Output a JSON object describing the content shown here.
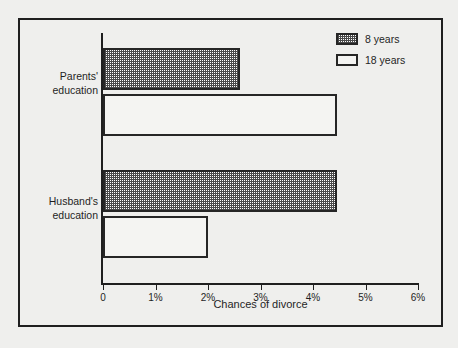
{
  "chart_data": {
    "type": "bar",
    "orientation": "horizontal",
    "title": "",
    "xlabel": "Chances of divorce",
    "ylabel": "",
    "xlim": [
      0,
      6
    ],
    "xtick_labels": [
      "0",
      "1%",
      "2%",
      "3%",
      "4%",
      "5%",
      "6%"
    ],
    "xtick_values": [
      0,
      1,
      2,
      3,
      4,
      5,
      6
    ],
    "grid": false,
    "legend_position": "top-right",
    "categories": [
      "Parents' education",
      "Husband's education"
    ],
    "category_lines": [
      [
        "Parents'",
        "education"
      ],
      [
        "Husband's",
        "education"
      ]
    ],
    "series": [
      {
        "name": "8 years",
        "values": [
          2.6,
          4.45
        ],
        "fill": "hatch-checker",
        "color": "#4a4a4a"
      },
      {
        "name": "18 years",
        "values": [
          4.45,
          2.0
        ],
        "fill": "solid",
        "color": "#f4f4f2"
      }
    ],
    "bars": [
      {
        "category": "Parents' education",
        "series": "8 years",
        "value": 2.6,
        "value_label": "2.6%"
      },
      {
        "category": "Parents' education",
        "series": "18 years",
        "value": 4.45,
        "value_label": "4.45%"
      },
      {
        "category": "Husband's education",
        "series": "8 years",
        "value": 4.45,
        "value_label": "4.45%"
      },
      {
        "category": "Husband's education",
        "series": "18 years",
        "value": 2.0,
        "value_label": "2%"
      }
    ]
  },
  "legend": {
    "items": [
      {
        "label": "8 years"
      },
      {
        "label": "18 years"
      }
    ]
  },
  "axis": {
    "x_title": "Chances of divorce",
    "ticks": [
      "0",
      "1%",
      "2%",
      "3%",
      "4%",
      "5%",
      "6%"
    ]
  },
  "categories": {
    "parents": {
      "line1": "Parents'",
      "line2": "education"
    },
    "husband": {
      "line1": "Husband's",
      "line2": "education"
    }
  },
  "colors": {
    "background": "#efefed",
    "frame": "#1f1f1f",
    "axis": "#1f1f1f",
    "bar_hatch": "#4a4a4a",
    "bar_open": "#f4f4f2",
    "text": "#1f1f1f"
  }
}
